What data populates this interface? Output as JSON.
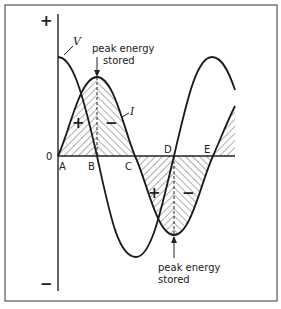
{
  "diagram": {
    "title": "",
    "axis": {
      "plus_label": "+",
      "minus_label": "−",
      "zero_label": "0"
    },
    "curves": {
      "voltage_label": "V",
      "current_label": "I"
    },
    "points": [
      "A",
      "B",
      "C",
      "D",
      "E"
    ],
    "regions": {
      "region1_left_sign": "+",
      "region1_right_sign": "−",
      "region2_left_sign": "+",
      "region2_right_sign": "−"
    },
    "annotations": {
      "top_line1": "peak energy",
      "top_line2": "stored",
      "bottom_line1": "peak energy",
      "bottom_line2": "stored"
    },
    "colors": {
      "line": "#1a1a1a",
      "frame": "#555555",
      "background": "#ffffff"
    }
  }
}
